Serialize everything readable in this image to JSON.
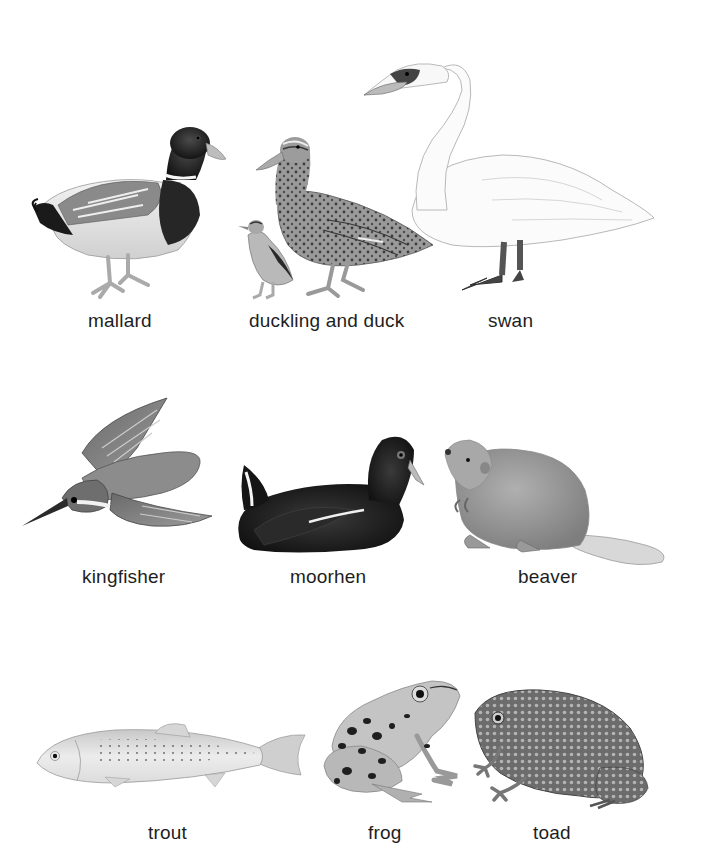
{
  "plate": {
    "rows": [
      {
        "animals": [
          {
            "name": "mallard",
            "label": "mallard"
          },
          {
            "name": "duckling-and-duck",
            "label": "duckling and duck"
          },
          {
            "name": "swan",
            "label": "swan"
          }
        ]
      },
      {
        "animals": [
          {
            "name": "kingfisher",
            "label": "kingfisher"
          },
          {
            "name": "moorhen",
            "label": "moorhen"
          },
          {
            "name": "beaver",
            "label": "beaver"
          }
        ]
      },
      {
        "animals": [
          {
            "name": "trout",
            "label": "trout"
          },
          {
            "name": "frog",
            "label": "frog"
          },
          {
            "name": "toad",
            "label": "toad"
          }
        ]
      }
    ],
    "colors": {
      "background": "#ffffff",
      "label_text": "#1e1e1e"
    }
  }
}
